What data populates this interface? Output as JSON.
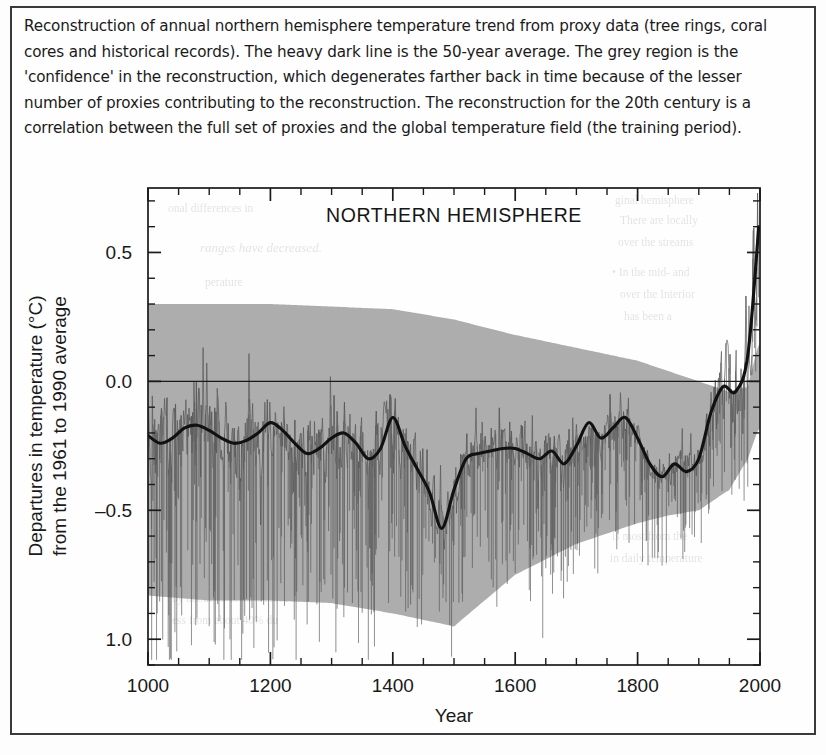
{
  "figure": {
    "caption": "Reconstruction of annual northern hemisphere temperature trend from proxy data (tree rings, coral cores and historical records). The heavy dark line is the 50-year average. The grey region is the 'confidence' in the reconstruction, which degenerates farther back in time because of the lesser number of proxies contributing to the reconstruction. The reconstruction for the 20th century is a correlation between the full set of proxies and the global temperature field (the training period)."
  },
  "chart_data": {
    "type": "line",
    "title": "NORTHERN HEMISPHERE",
    "xlabel": "Year",
    "ylabel_line1": "Departures in temperature (°C)",
    "ylabel_line2": "from the 1961 to 1990 average",
    "xlim": [
      1000,
      2000
    ],
    "ylim": [
      -1.1,
      0.75
    ],
    "xticks": [
      1000,
      1200,
      1400,
      1600,
      1800,
      2000
    ],
    "xtick_labels": [
      "1000",
      "1200",
      "1400",
      "1600",
      "1800",
      "2000"
    ],
    "yticks": [
      0.5,
      0.0,
      -0.5,
      -1.0
    ],
    "ytick_labels": [
      "0.5",
      "0.0",
      "–0.5",
      "1.0"
    ],
    "minor_tick_step": 0.1,
    "grid": false,
    "legend": null,
    "zero_line": 0.0,
    "colors": {
      "confidence_band": "#a8a8a8",
      "annual_series": "#5d5d5d",
      "smoothed_line": "#141414",
      "axis": "#1a1a1a",
      "background": "#fefefe"
    },
    "series": [
      {
        "name": "50-year average (smoothed reconstruction)",
        "style": "heavy-dark-line",
        "x": [
          1000,
          1020,
          1040,
          1060,
          1080,
          1100,
          1120,
          1140,
          1160,
          1180,
          1200,
          1220,
          1240,
          1260,
          1280,
          1300,
          1320,
          1340,
          1360,
          1380,
          1400,
          1420,
          1440,
          1460,
          1480,
          1500,
          1520,
          1540,
          1560,
          1580,
          1600,
          1620,
          1640,
          1660,
          1680,
          1700,
          1720,
          1740,
          1760,
          1780,
          1800,
          1820,
          1840,
          1860,
          1880,
          1900,
          1920,
          1940,
          1960,
          1980,
          1998
        ],
        "values": [
          -0.21,
          -0.24,
          -0.22,
          -0.18,
          -0.17,
          -0.19,
          -0.22,
          -0.24,
          -0.23,
          -0.2,
          -0.16,
          -0.19,
          -0.24,
          -0.28,
          -0.26,
          -0.22,
          -0.2,
          -0.24,
          -0.3,
          -0.26,
          -0.14,
          -0.25,
          -0.34,
          -0.43,
          -0.57,
          -0.42,
          -0.3,
          -0.28,
          -0.27,
          -0.26,
          -0.26,
          -0.28,
          -0.3,
          -0.27,
          -0.32,
          -0.25,
          -0.16,
          -0.22,
          -0.18,
          -0.14,
          -0.22,
          -0.32,
          -0.37,
          -0.32,
          -0.35,
          -0.3,
          -0.12,
          -0.02,
          -0.04,
          0.1,
          0.6
        ]
      },
      {
        "name": "Annual reconstruction",
        "style": "thin-grey-line"
      },
      {
        "name": "Confidence interval (two standard error)",
        "style": "grey-shaded-band"
      }
    ],
    "confidence_band": {
      "x": [
        1000,
        1100,
        1200,
        1300,
        1400,
        1500,
        1600,
        1700,
        1800,
        1850,
        1900,
        1950,
        1980,
        1998
      ],
      "upper": [
        0.3,
        0.3,
        0.3,
        0.29,
        0.28,
        0.24,
        0.18,
        0.13,
        0.08,
        0.04,
        0.0,
        -0.04,
        -0.02,
        0.15
      ],
      "lower": [
        -0.83,
        -0.85,
        -0.85,
        -0.86,
        -0.9,
        -0.95,
        -0.75,
        -0.63,
        -0.55,
        -0.52,
        -0.5,
        -0.42,
        -0.3,
        -0.18
      ]
    }
  }
}
